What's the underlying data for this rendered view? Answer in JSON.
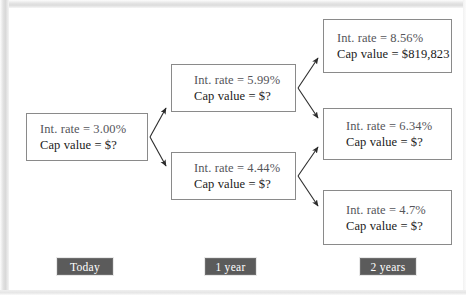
{
  "diagram": {
    "type": "binomial-interest-rate-tree",
    "nodes": [
      {
        "id": "root",
        "column": 0,
        "rate_label": "Int. rate = 3.00%",
        "value_label": "Cap value = $?"
      },
      {
        "id": "up-1",
        "column": 1,
        "rate_label": "Int. rate = 5.99%",
        "value_label": "Cap value = $?"
      },
      {
        "id": "down-1",
        "column": 1,
        "rate_label": "Int. rate = 4.44%",
        "value_label": "Cap value = $?"
      },
      {
        "id": "up-up-2",
        "column": 2,
        "rate_label": "Int. rate = 8.56%",
        "value_label": "Cap value = $819,823"
      },
      {
        "id": "mid-2",
        "column": 2,
        "rate_label": "Int. rate = 6.34%",
        "value_label": "Cap value = $?"
      },
      {
        "id": "down-down-2",
        "column": 2,
        "rate_label": "Int. rate = 4.7%",
        "value_label": "Cap value = $?"
      }
    ],
    "timeline": [
      {
        "id": "today",
        "label": "Today"
      },
      {
        "id": "year-1",
        "label": "1 year"
      },
      {
        "id": "year-2",
        "label": "2 years"
      }
    ],
    "colors": {
      "node_border": "#8a8a8a",
      "node_background": "#ffffff",
      "text": "#1a1a1a",
      "rate_text": "#55555a",
      "timeline_background": "#5b5b5b",
      "timeline_text": "#ffffff",
      "arrow": "#2b2b2b",
      "frame": "#e2e2e2"
    }
  }
}
